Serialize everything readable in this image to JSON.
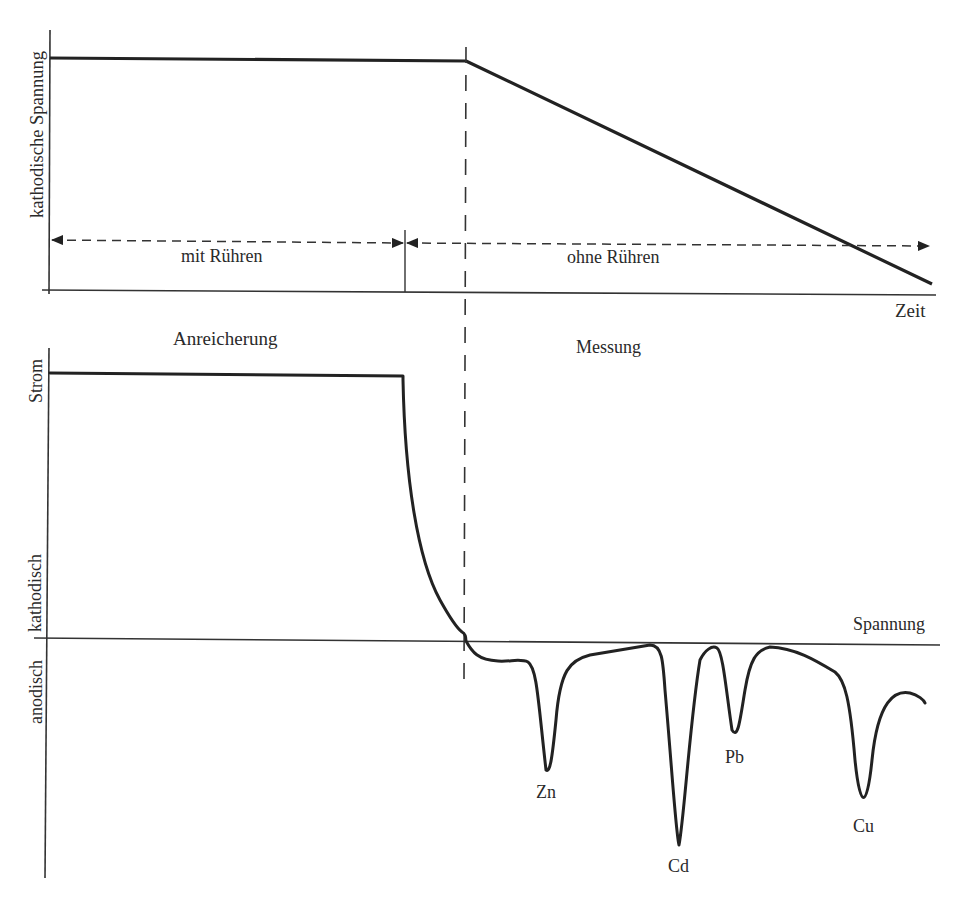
{
  "top_panel": {
    "y_axis_label": "kathodische Spannung",
    "x_axis_label": "Zeit",
    "phase_stirring_label": "mit Rühren",
    "phase_no_stirring_label": "ohne Rühren",
    "voltage_profile": {
      "description": "constant cathodic voltage during enrichment, then linear sweep during measurement",
      "points_px": [
        [
          50,
          58
        ],
        [
          466,
          61
        ],
        [
          932,
          284
        ]
      ]
    }
  },
  "phase_labels": {
    "enrichment": "Anreicherung",
    "measurement": "Messung"
  },
  "bottom_panel": {
    "y_axis_label_top": "Strom",
    "y_axis_label_cathodic": "kathodisch",
    "y_axis_label_anodic": "anodisch",
    "x_axis_label": "Spannung",
    "peaks": [
      {
        "label": "Zn",
        "relative_depth": 0.55
      },
      {
        "label": "Cd",
        "relative_depth": 1.0
      },
      {
        "label": "Pb",
        "relative_depth": 0.45
      },
      {
        "label": "Cu",
        "relative_depth": 0.8
      }
    ]
  },
  "colors": {
    "line": "#222222",
    "background": "#ffffff"
  }
}
